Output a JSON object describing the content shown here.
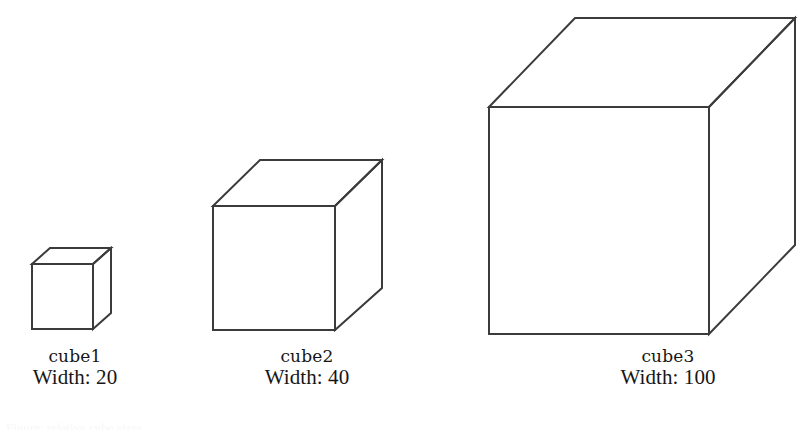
{
  "page": {
    "background_color": "#ffffff",
    "line_color": "#3b3b3b",
    "text_color": "#161616",
    "width": 810,
    "height": 431
  },
  "figure": {
    "name": "cube-size-comparison"
  },
  "cubes": [
    {
      "name": "cube1",
      "width_label": "Width: 20",
      "width_value": 20,
      "front": {
        "x": 32,
        "y": 264,
        "size": 61
      },
      "depth": {
        "dx": 18,
        "dy": -16
      }
    },
    {
      "name": "cube2",
      "width_label": "Width: 40",
      "width_value": 40,
      "front": {
        "x": 213,
        "y": 206,
        "size": 122
      },
      "depth": {
        "dx": 47,
        "dy": -46
      }
    },
    {
      "name": "cube3",
      "width_label": "Width: 100",
      "width_value": 100,
      "front": {
        "x": 489,
        "y": 107,
        "size": 221
      },
      "depth": {
        "dx": 86,
        "dy": -89
      }
    }
  ],
  "labels": {
    "cube1": {
      "name": "cube1",
      "width": "Width: 20"
    },
    "cube2": {
      "name": "cube2",
      "width": "Width: 40"
    },
    "cube3": {
      "name": "cube3",
      "width": "Width: 100"
    }
  },
  "artifacts": {
    "bottom_cut_text": "Figure: relative cube sizes"
  }
}
